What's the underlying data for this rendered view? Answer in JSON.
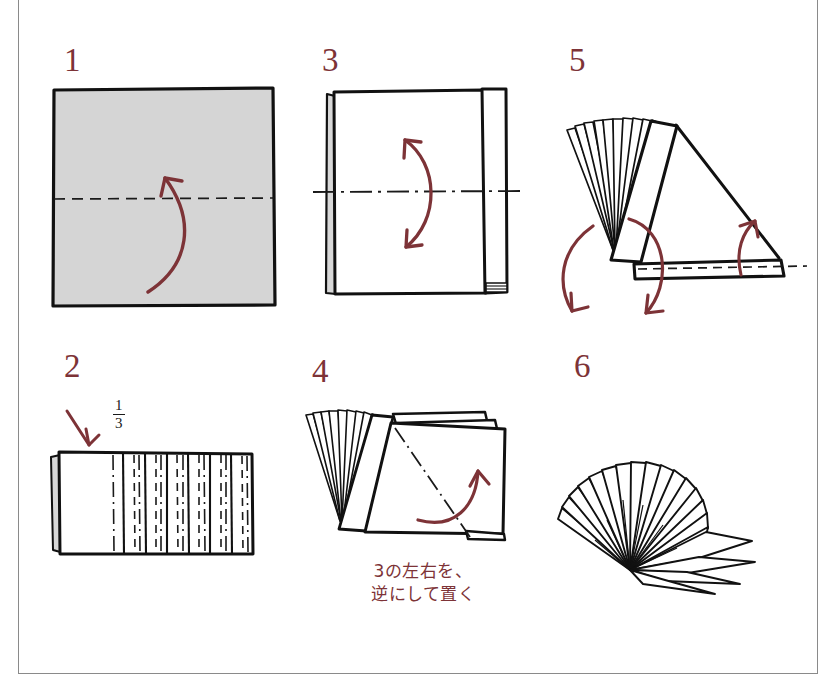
{
  "page": {
    "language": "ja",
    "background": "#ffffff",
    "border_color": "#8a8a8a",
    "accent_color": "#7d3337",
    "ink_color": "#111111",
    "paper_fill": "#d5d5d5",
    "fold_line_color": "#1a1a1a"
  },
  "steps": [
    {
      "id": "step-1",
      "number": "1",
      "description": "Square sheet, shaded side up, with a horizontal dashed valley fold line across the middle and a curved arrow folding the bottom edge up.",
      "fold_lines": [
        {
          "type": "valley-dashed",
          "orientation": "horizontal"
        }
      ],
      "arrows": [
        {
          "type": "curved-fold-up",
          "color": "#7d3337"
        }
      ]
    },
    {
      "id": "step-2",
      "number": "2",
      "label_fraction_numerator": "1",
      "label_fraction_denominator": "3",
      "description": "Folded rectangle pleated in accordion folds over two thirds of its width; leftmost third left flat. Alternating dashed valley and dash-dot mountain creases.",
      "fold_lines": [
        {
          "type": "valley-dashed",
          "orientation": "vertical"
        },
        {
          "type": "mountain-dashdot",
          "orientation": "vertical"
        }
      ],
      "arrows": [
        {
          "type": "straight-down-left",
          "color": "#7d3337"
        }
      ]
    },
    {
      "id": "step-3",
      "number": "3",
      "description": "Pleated bundle seen flat, with a horizontal dash-dot mountain centre line and a double-headed curved arrow indicating fold in half.",
      "fold_lines": [
        {
          "type": "mountain-dashdot",
          "orientation": "horizontal"
        }
      ],
      "arrows": [
        {
          "type": "curved-double-headed",
          "color": "#7d3337"
        }
      ]
    },
    {
      "id": "step-4",
      "number": "4",
      "caption": "3の左右を、\n逆にして置く",
      "caption_translation_note": "Place step 3 with left and right reversed",
      "description": "Pleated fan standing with spread leaves at left and a flat flap at right bearing a diagonal dash-dot mountain line; curved arrow lifts the flap.",
      "fold_lines": [
        {
          "type": "mountain-dashdot",
          "orientation": "diagonal"
        }
      ],
      "arrows": [
        {
          "type": "curved-fold-up",
          "color": "#7d3337"
        }
      ]
    },
    {
      "id": "step-5",
      "number": "5",
      "description": "Three-dimensional view of the fan: spread pleats upper left, an inclined panel, a long flat base strip with a dashed line, and three curved arrows showing the opening rotation.",
      "fold_lines": [
        {
          "type": "valley-dashed",
          "orientation": "horizontal"
        }
      ],
      "arrows": [
        {
          "type": "curved-rotate-left",
          "color": "#7d3337"
        },
        {
          "type": "curved-rotate-down",
          "color": "#7d3337"
        },
        {
          "type": "curved-lift-right",
          "color": "#7d3337"
        }
      ]
    },
    {
      "id": "step-6",
      "number": "6",
      "description": "Finished fan fully spread into a radial arrangement of pleated blades converging at a single point at lower left.",
      "fold_lines": [],
      "arrows": []
    }
  ]
}
